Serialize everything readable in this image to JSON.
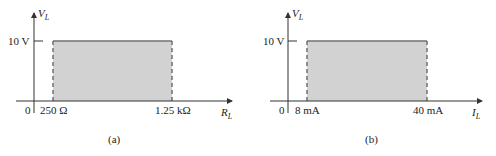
{
  "panels": [
    {
      "id": "a",
      "caption": "(a)",
      "y_axis": {
        "symbol": "V",
        "subscript": "L"
      },
      "x_axis": {
        "symbol": "R",
        "subscript": "L"
      },
      "origin_label": "0",
      "y_tick_label": "10 V",
      "x_min_label": "250 Ω",
      "x_max_label": "1.25 kΩ",
      "region": {
        "x_min": "250 Ω",
        "x_max": "1.25 kΩ",
        "y_value": "10 V"
      }
    },
    {
      "id": "b",
      "caption": "(b)",
      "y_axis": {
        "symbol": "V",
        "subscript": "L"
      },
      "x_axis": {
        "symbol": "I",
        "subscript": "L"
      },
      "origin_label": "0",
      "y_tick_label": "10 V",
      "x_min_label": "8 mA",
      "x_max_label": "40 mA",
      "region": {
        "x_min": "8 mA",
        "x_max": "40 mA",
        "y_value": "10 V"
      }
    }
  ],
  "colors": {
    "fill": "#d2d2d2",
    "border": "#707070",
    "axis": "#333333"
  }
}
